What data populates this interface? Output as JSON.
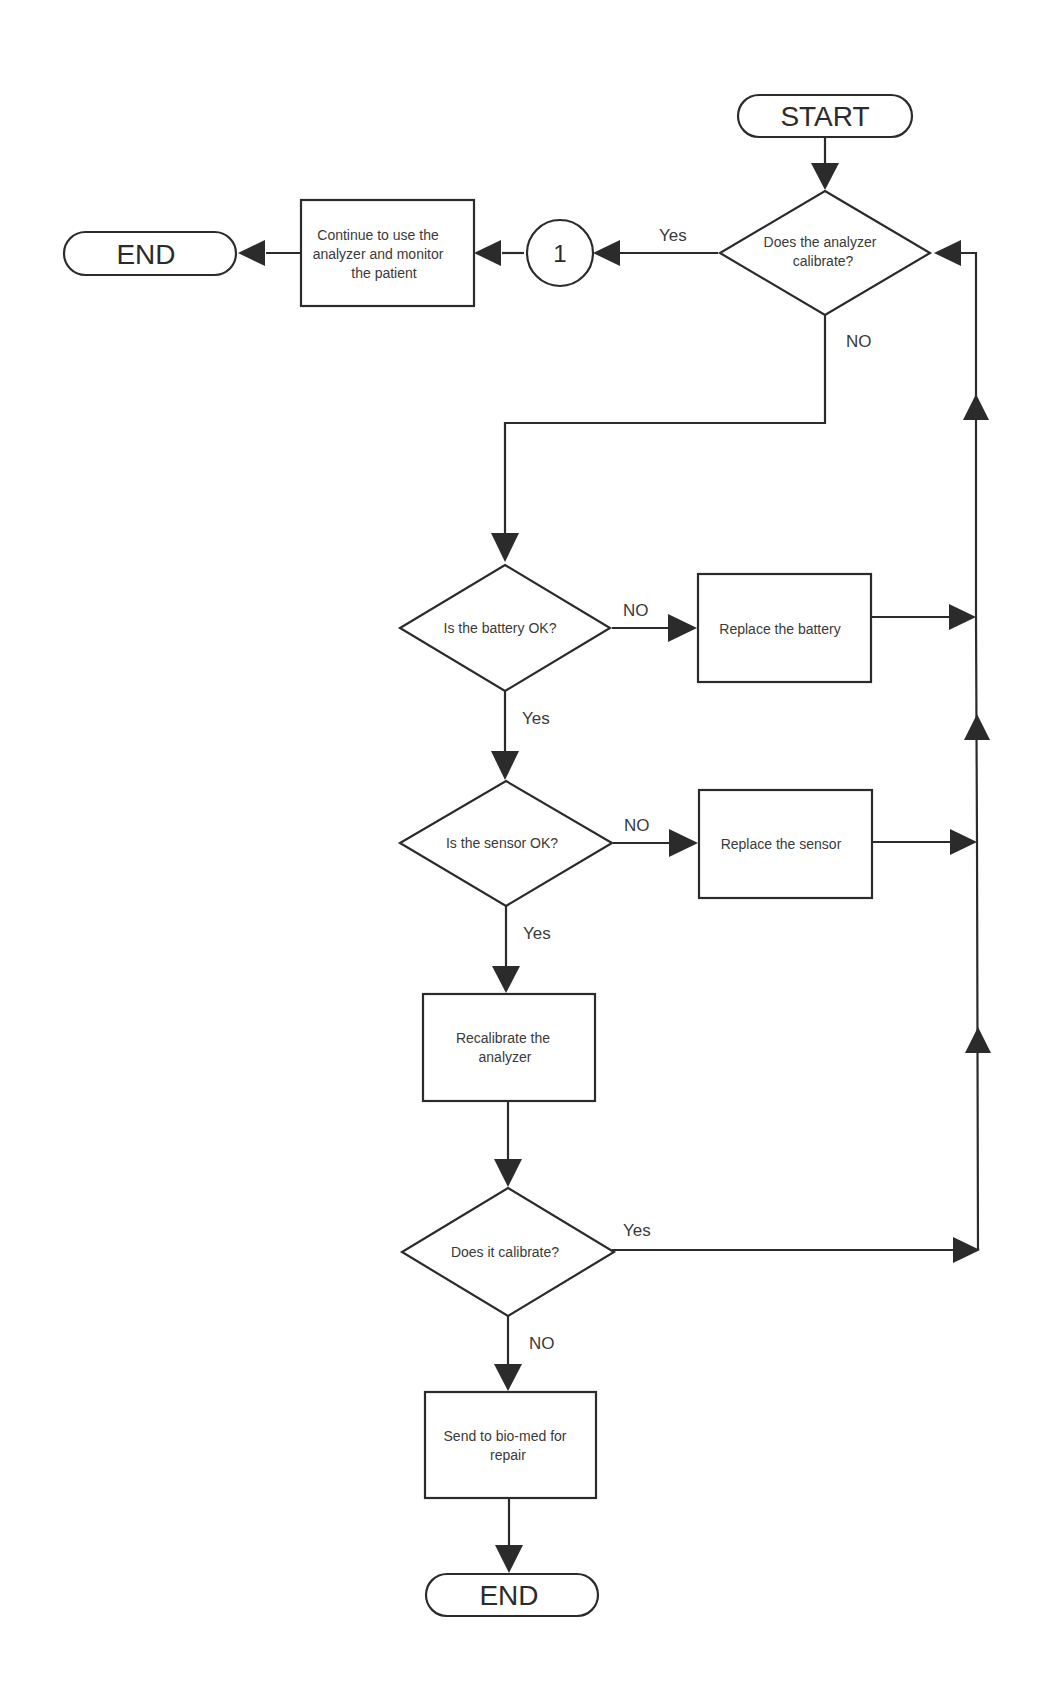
{
  "flowchart": {
    "colors": {
      "stroke": "#2b2b2b",
      "text": "#3a3a3a",
      "background": "#ffffff"
    },
    "nodes": {
      "start": {
        "type": "terminal",
        "label": "START"
      },
      "q_analyzer_calibrate": {
        "type": "decision",
        "lines": [
          "Does the analyzer",
          "calibrate?"
        ]
      },
      "connector_1": {
        "type": "connector",
        "label": "1"
      },
      "continue_monitor": {
        "type": "process",
        "lines": [
          "Continue to use the",
          "analyzer and monitor",
          "the patient"
        ]
      },
      "end_top": {
        "type": "terminal",
        "label": "END"
      },
      "q_battery_ok": {
        "type": "decision",
        "lines": [
          "Is the battery OK?"
        ]
      },
      "replace_battery": {
        "type": "process",
        "lines": [
          "Replace the battery"
        ]
      },
      "q_sensor_ok": {
        "type": "decision",
        "lines": [
          "Is the sensor OK?"
        ]
      },
      "replace_sensor": {
        "type": "process",
        "lines": [
          "Replace the sensor"
        ]
      },
      "recalibrate": {
        "type": "process",
        "lines": [
          "Recalibrate the",
          "analyzer"
        ]
      },
      "q_does_it_calibrate": {
        "type": "decision",
        "lines": [
          "Does it calibrate?"
        ]
      },
      "send_biomed": {
        "type": "process",
        "lines": [
          "Send to bio-med for",
          "repair"
        ]
      },
      "end_bottom": {
        "type": "terminal",
        "label": "END"
      }
    },
    "edge_labels": {
      "analyzer_yes": "Yes",
      "analyzer_no": "NO",
      "battery_no": "NO",
      "battery_yes": "Yes",
      "sensor_no": "NO",
      "sensor_yes": "Yes",
      "calibrate_yes": "Yes",
      "calibrate_no": "NO"
    },
    "edges": [
      {
        "from": "start",
        "to": "q_analyzer_calibrate"
      },
      {
        "from": "q_analyzer_calibrate",
        "to": "connector_1",
        "label": "Yes"
      },
      {
        "from": "connector_1",
        "to": "continue_monitor"
      },
      {
        "from": "continue_monitor",
        "to": "end_top"
      },
      {
        "from": "q_analyzer_calibrate",
        "to": "q_battery_ok",
        "label": "NO"
      },
      {
        "from": "q_battery_ok",
        "to": "replace_battery",
        "label": "NO"
      },
      {
        "from": "q_battery_ok",
        "to": "q_sensor_ok",
        "label": "Yes"
      },
      {
        "from": "q_sensor_ok",
        "to": "replace_sensor",
        "label": "NO"
      },
      {
        "from": "q_sensor_ok",
        "to": "recalibrate",
        "label": "Yes"
      },
      {
        "from": "recalibrate",
        "to": "q_does_it_calibrate"
      },
      {
        "from": "q_does_it_calibrate",
        "to": "send_biomed",
        "label": "NO"
      },
      {
        "from": "send_biomed",
        "to": "end_bottom"
      },
      {
        "from": "replace_battery",
        "to": "q_analyzer_calibrate",
        "via": "right-return-line"
      },
      {
        "from": "replace_sensor",
        "to": "q_analyzer_calibrate",
        "via": "right-return-line"
      },
      {
        "from": "q_does_it_calibrate",
        "to": "q_analyzer_calibrate",
        "label": "Yes",
        "via": "right-return-line"
      }
    ]
  }
}
